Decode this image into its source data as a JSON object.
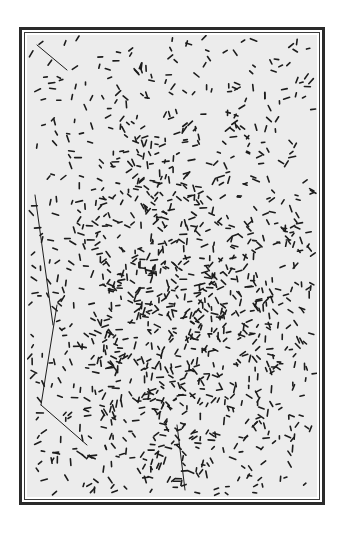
{
  "image": {
    "subject": "micrograph of rod-shaped bacteria (bacilli)",
    "frame": {
      "style": "double-line border",
      "color": "#2a2a2a"
    },
    "background_color": "#ececec",
    "rod_color": "#1c1c1c",
    "field": {
      "width": 290,
      "height": 462
    },
    "rods": {
      "count": 1400,
      "length_min": 3,
      "length_max": 7,
      "thickness": 1.6,
      "density_center": [
        150,
        270
      ],
      "density_spread": [
        85,
        120
      ],
      "seed": 7
    },
    "filaments": [
      {
        "x1": 8,
        "y1": 160,
        "x2": 26,
        "y2": 290
      },
      {
        "x1": 30,
        "y1": 270,
        "x2": 14,
        "y2": 370
      },
      {
        "x1": 14,
        "y1": 370,
        "x2": 60,
        "y2": 410
      },
      {
        "x1": 150,
        "y1": 390,
        "x2": 158,
        "y2": 455
      },
      {
        "x1": 10,
        "y1": 10,
        "x2": 40,
        "y2": 35
      }
    ]
  }
}
